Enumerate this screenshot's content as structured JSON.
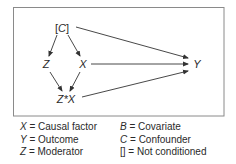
{
  "diagram": {
    "frame": {
      "x": 13.5,
      "y": 7.5,
      "width": 210.5,
      "height": 108.5,
      "stroke": "#8a8a8a"
    },
    "edge_color": "#333333",
    "nodes": [
      {
        "id": "C",
        "label_open": "[",
        "label": "C",
        "label_close": "]",
        "x": 62,
        "y": 28
      },
      {
        "id": "Z",
        "label": "Z",
        "x": 46,
        "y": 64
      },
      {
        "id": "X",
        "label": "X",
        "x": 83,
        "y": 64
      },
      {
        "id": "ZX",
        "label": "Z*X",
        "x": 66,
        "y": 99
      },
      {
        "id": "Y",
        "label": "Y",
        "x": 197,
        "y": 64
      }
    ],
    "edges": [
      {
        "from": "C",
        "to": "Z",
        "x1": 57,
        "y1": 35,
        "x2": 49,
        "y2": 56
      },
      {
        "from": "C",
        "to": "X",
        "x1": 68,
        "y1": 35,
        "x2": 80,
        "y2": 56
      },
      {
        "from": "C",
        "to": "Y",
        "x1": 76,
        "y1": 27,
        "x2": 188,
        "y2": 58
      },
      {
        "from": "X",
        "to": "Y",
        "x1": 91,
        "y1": 64,
        "x2": 188,
        "y2": 64
      },
      {
        "from": "Z",
        "to": "ZX",
        "x1": 50,
        "y1": 72,
        "x2": 62,
        "y2": 91
      },
      {
        "from": "X",
        "to": "ZX",
        "x1": 80,
        "y1": 72,
        "x2": 70,
        "y2": 91
      },
      {
        "from": "ZX",
        "to": "Y",
        "x1": 82,
        "y1": 97,
        "x2": 188,
        "y2": 71
      }
    ]
  },
  "legend": {
    "left": [
      {
        "symbol": "X",
        "text": " = Causal factor"
      },
      {
        "symbol": "Y",
        "text": " = Outcome"
      },
      {
        "symbol": "Z",
        "text": " = Moderator"
      }
    ],
    "right": [
      {
        "symbol": "B",
        "text": " = Covariate"
      },
      {
        "symbol": "C",
        "text": " = Confounder"
      },
      {
        "symbol": "[]",
        "text": " = Not conditioned",
        "upright": true
      }
    ]
  }
}
